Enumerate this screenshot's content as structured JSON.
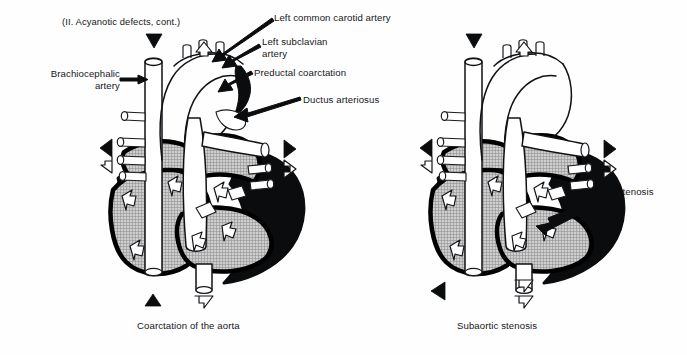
{
  "page": {
    "heading": "(II. Acyanotic defects, cont.)",
    "background_color": "#fefefe",
    "ink_color": "#111216",
    "chamber_gray": "#b3b3b3",
    "chamber_black": "#0b0c0e"
  },
  "labels": {
    "brachiocephalic_artery": "Brachiocephalic\nartery",
    "left_common_carotid_artery": "Left common carotid artery",
    "left_subclavian_artery": "Left subclavian\nartery",
    "preductal_coarctation": "Preductal coarctation",
    "ductus_arteriosus": "Ductus arteriosus",
    "stenosis": "Stenosis"
  },
  "captions": {
    "left": "Coarctation of the aorta",
    "right": "Subaortic stenosis"
  },
  "diagrams": [
    {
      "name": "coarctation-of-the-aorta",
      "caption": "Coarctation of the aorta",
      "callouts": [
        "Brachiocephalic artery",
        "Left common carotid artery",
        "Left subclavian artery",
        "Preductal coarctation",
        "Ductus arteriosus"
      ],
      "flow_arrows": {
        "black_filled": 4,
        "white_outline": 3
      }
    },
    {
      "name": "subaortic-stenosis",
      "caption": "Subaortic stenosis",
      "callouts": [
        "Stenosis"
      ],
      "flow_arrows": {
        "black_filled": 3,
        "white_outline": 3
      }
    }
  ]
}
